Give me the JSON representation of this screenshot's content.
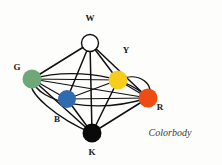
{
  "figure": {
    "title": "Colorbody",
    "caption": "Colorbody",
    "background_color": "#fdfdfc",
    "edge_color": "#101010"
  },
  "nodes": [
    {
      "id": "W",
      "label": "W",
      "name": "white",
      "color": "#ffffff",
      "outlined": true,
      "cx": 90,
      "cy": 43,
      "r": 8.5,
      "label_x": 90,
      "label_y": 21
    },
    {
      "id": "G",
      "label": "G",
      "name": "green",
      "color": "#6fa878",
      "outlined": false,
      "cx": 32,
      "cy": 79,
      "r": 9.5,
      "label_x": 17,
      "label_y": 70
    },
    {
      "id": "Y",
      "label": "Y",
      "name": "yellow",
      "color": "#f6cd1d",
      "outlined": false,
      "cx": 118,
      "cy": 80,
      "r": 9.5,
      "label_x": 126,
      "label_y": 53
    },
    {
      "id": "B",
      "label": "B",
      "name": "blue",
      "color": "#2f6bb0",
      "outlined": false,
      "cx": 67,
      "cy": 99,
      "r": 9.0,
      "label_x": 57,
      "label_y": 122
    },
    {
      "id": "R",
      "label": "R",
      "name": "red",
      "color": "#ee4b15",
      "outlined": false,
      "cx": 148,
      "cy": 98,
      "r": 9.5,
      "label_x": 160,
      "label_y": 110
    },
    {
      "id": "K",
      "label": "K",
      "name": "black",
      "color": "#0a0a0a",
      "outlined": false,
      "cx": 92,
      "cy": 133,
      "r": 9.5,
      "label_x": 92,
      "label_y": 155
    }
  ],
  "edges": [
    {
      "from": "W",
      "to": "G",
      "style": "straight",
      "width": 1.5
    },
    {
      "from": "W",
      "to": "Y",
      "style": "straight",
      "width": 1.5
    },
    {
      "from": "W",
      "to": "B",
      "style": "straight",
      "width": 1.5
    },
    {
      "from": "W",
      "to": "R",
      "style": "straight",
      "width": 1.5
    },
    {
      "from": "W",
      "to": "K",
      "style": "straight",
      "width": 1.5
    },
    {
      "from": "K",
      "to": "G",
      "style": "straight",
      "width": 1.5
    },
    {
      "from": "K",
      "to": "Y",
      "style": "straight",
      "width": 1.5
    },
    {
      "from": "K",
      "to": "B",
      "style": "straight",
      "width": 1.5
    },
    {
      "from": "K",
      "to": "R",
      "style": "straight",
      "width": 1.5
    },
    {
      "from": "G",
      "to": "Y",
      "style": "straight",
      "width": 1.2
    },
    {
      "from": "G",
      "to": "B",
      "style": "straight",
      "width": 1.2
    },
    {
      "from": "G",
      "to": "R",
      "style": "straight",
      "width": 1.2
    },
    {
      "from": "B",
      "to": "Y",
      "style": "straight",
      "width": 1.2
    },
    {
      "from": "B",
      "to": "R",
      "style": "straight",
      "width": 1.2
    },
    {
      "from": "Y",
      "to": "R",
      "style": "straight",
      "width": 1.2
    }
  ],
  "outer_curves": [
    {
      "name": "equator-front",
      "path": "M 32 79 C 38 104, 96 114, 148 98",
      "width": 1.4
    },
    {
      "name": "equator-back",
      "path": "M 32 79 C 62 70, 120 70, 148 98",
      "width": 1.2
    },
    {
      "name": "hull-left",
      "path": "M 32 79 C 24 92, 60 120, 92 133",
      "width": 1.4
    },
    {
      "name": "hull-right",
      "path": "M 148 98 C 156 86, 140 70, 118 80",
      "width": 1.4
    }
  ]
}
